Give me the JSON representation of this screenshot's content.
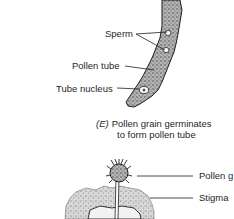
{
  "panel_e": {
    "labels": {
      "sperm": "Sperm",
      "pollen_tube": "Pollen tube",
      "tube_nucleus": "Tube nucleus"
    },
    "caption": {
      "tag": "(E)",
      "line1": "Pollen grain germinates",
      "line2": "to form pollen tube"
    }
  },
  "panel_f": {
    "labels": {
      "pollen_grain": "Pollen g",
      "stigma": "Stigma"
    }
  },
  "colors": {
    "ink": "#1f1f1f",
    "stipple_dark": "#3a3a3a",
    "stipple_mid": "#8a8a8a",
    "background": "#ffffff"
  }
}
